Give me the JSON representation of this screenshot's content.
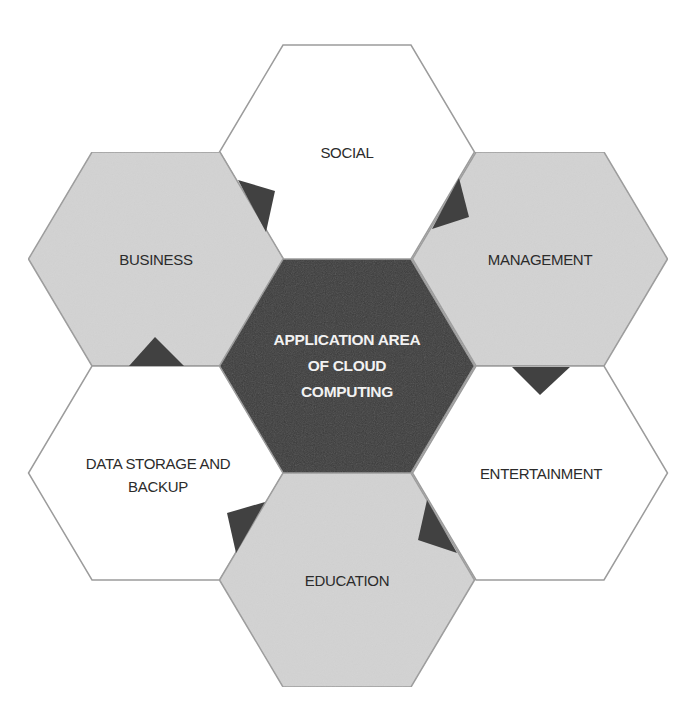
{
  "diagram": {
    "title": "APPLICATION AREA OF CLOUD COMPUTING",
    "colors": {
      "center_fill": "#3c3c3c",
      "gray_fill": "#d3d3d3",
      "white_fill": "#ffffff",
      "stroke": "#9c9c9c",
      "arrow_fill": "#414141",
      "label_dark": "#2b2b2b",
      "label_light": "#f2f2f2"
    },
    "hexagons": [
      {
        "id": "center",
        "label": "APPLICATION AREA\nOF CLOUD\nCOMPUTING",
        "cx": 347,
        "cy": 366,
        "fill": "center"
      },
      {
        "id": "social",
        "label": "SOCIAL",
        "cx": 347,
        "cy": 152,
        "fill": "white"
      },
      {
        "id": "business",
        "label": "BUSINESS",
        "cx": 156,
        "cy": 259,
        "fill": "gray"
      },
      {
        "id": "management",
        "label": "MANAGEMENT",
        "cx": 540,
        "cy": 259,
        "fill": "gray"
      },
      {
        "id": "data-storage",
        "label": "DATA STORAGE AND\nBACKUP",
        "cx": 156,
        "cy": 473,
        "fill": "white"
      },
      {
        "id": "entertainment",
        "label": "ENTERTAINMENT",
        "cx": 540,
        "cy": 473,
        "fill": "white"
      },
      {
        "id": "education",
        "label": "EDUCATION",
        "cx": 347,
        "cy": 580,
        "fill": "gray"
      }
    ],
    "connector_triangles": [
      {
        "between": "social-business",
        "points": "238,180 275,191 266,232"
      },
      {
        "between": "social-management",
        "points": "459,178 469,217 432,229"
      },
      {
        "between": "business-data-storage",
        "points": "129,366 155,337 184,366"
      },
      {
        "between": "management-entertainment",
        "points": "512,367 570,367 540,395"
      },
      {
        "between": "data-storage-education",
        "points": "227,513 265,502 236,553"
      },
      {
        "between": "entertainment-education",
        "points": "427,500 418,540 457,553"
      }
    ]
  },
  "labels": {
    "center": "APPLICATION AREA\nOF CLOUD\nCOMPUTING",
    "social": "SOCIAL",
    "business": "BUSINESS",
    "management": "MANAGEMENT",
    "data_storage": "DATA STORAGE AND\nBACKUP",
    "entertainment": "ENTERTAINMENT",
    "education": "EDUCATION"
  }
}
